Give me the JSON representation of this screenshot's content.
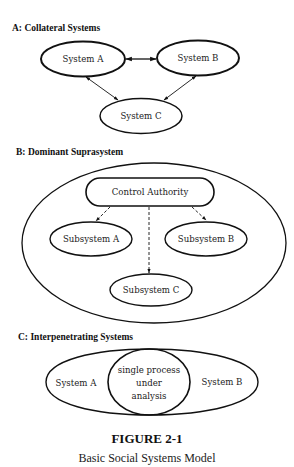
{
  "sections": [
    {
      "title": "A: Collateral Systems",
      "nodes": [
        {
          "label": "System A"
        },
        {
          "label": "System B"
        },
        {
          "label": "System C"
        }
      ],
      "edges": [
        {
          "from": "System A",
          "to": "System B",
          "type": "bidirectional"
        },
        {
          "from": "System A",
          "to": "System C",
          "type": "bidirectional"
        },
        {
          "from": "System B",
          "to": "System C",
          "type": "bidirectional"
        }
      ]
    },
    {
      "title": "B: Dominant Suprasystem",
      "nodes": [
        {
          "label": "Control Authority"
        },
        {
          "label": "Subsystem A"
        },
        {
          "label": "Subsystem B"
        },
        {
          "label": "Subsystem C"
        }
      ],
      "edges": [
        {
          "from": "Control Authority",
          "to": "Subsystem A",
          "type": "dashed-arrow"
        },
        {
          "from": "Control Authority",
          "to": "Subsystem B",
          "type": "dashed-arrow"
        },
        {
          "from": "Control Authority",
          "to": "Subsystem C",
          "type": "dashed-arrow"
        }
      ]
    },
    {
      "title": "C: Interpenetrating Systems",
      "labels": {
        "left": "System A",
        "right": "System B",
        "center_lines": [
          "single process",
          "under",
          "analysis"
        ]
      }
    }
  ],
  "caption": {
    "figure": "FIGURE 2-1",
    "title": "Basic Social Systems Model"
  }
}
